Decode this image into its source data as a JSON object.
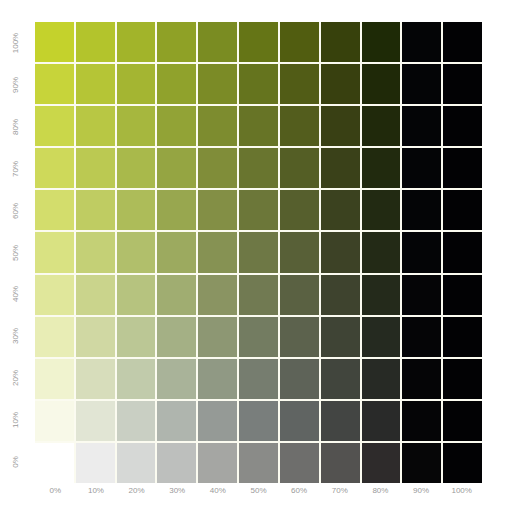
{
  "chart_data": {
    "type": "heatmap",
    "title": "",
    "xlabel": "",
    "ylabel": "",
    "x_ticks": [
      "0%",
      "10%",
      "20%",
      "30%",
      "40%",
      "50%",
      "60%",
      "70%",
      "80%",
      "90%",
      "100%"
    ],
    "y_ticks": [
      "100%",
      "90%",
      "80%",
      "70%",
      "60%",
      "50%",
      "40%",
      "30%",
      "20%",
      "10%",
      "0%"
    ],
    "colors": [
      [
        "#c4d22c",
        "#b3c42c",
        "#a2b42a",
        "#8fa126",
        "#7a8c22",
        "#657516",
        "#515d10",
        "#37410c",
        "#1e2a06",
        "#040506",
        "#020204"
      ],
      [
        "#c7d43a",
        "#b5c536",
        "#a4b532",
        "#90a22c",
        "#7b8b26",
        "#65741e",
        "#515c16",
        "#38400f",
        "#1f2908",
        "#040506",
        "#020204"
      ],
      [
        "#cad74a",
        "#b8c744",
        "#a6b73e",
        "#92a336",
        "#7d8c2f",
        "#677426",
        "#535d1d",
        "#394014",
        "#20290b",
        "#040506",
        "#020204"
      ],
      [
        "#ced95a",
        "#bbc952",
        "#a9b94b",
        "#95a542",
        "#808d39",
        "#69752f",
        "#545e25",
        "#3a4119",
        "#212a0e",
        "#040506",
        "#020204"
      ],
      [
        "#d3dd6c",
        "#bfcc62",
        "#adbc59",
        "#98a74f",
        "#838f45",
        "#6c7739",
        "#565f2d",
        "#3b421f",
        "#222a12",
        "#040506",
        "#020204"
      ],
      [
        "#d9e282",
        "#c4d076",
        "#b1bf6b",
        "#9caa5f",
        "#869253",
        "#6e7845",
        "#586037",
        "#3d4226",
        "#232a16",
        "#040506",
        "#020204"
      ],
      [
        "#e0e79b",
        "#cad48c",
        "#b6c37f",
        "#a0ad71",
        "#8a9462",
        "#717a52",
        "#5a6142",
        "#3e432e",
        "#242a1b",
        "#050506",
        "#020204"
      ],
      [
        "#e8edb5",
        "#d0d8a3",
        "#bbc795",
        "#a4b085",
        "#8d9773",
        "#737c61",
        "#5c624d",
        "#3f4435",
        "#252a20",
        "#050506",
        "#020204"
      ],
      [
        "#f0f3cf",
        "#d7ddbb",
        "#c1cbab",
        "#a9b399",
        "#909984",
        "#767d6f",
        "#5e6358",
        "#41453d",
        "#272a25",
        "#050506",
        "#020204"
      ],
      [
        "#f8f9e8",
        "#e1e5d4",
        "#c9cfc3",
        "#afb5ae",
        "#959a96",
        "#797e7c",
        "#606462",
        "#434543",
        "#292a29",
        "#050506",
        "#020204"
      ],
      [
        "#ffffff",
        "#ececec",
        "#d6d8d6",
        "#bdbfbd",
        "#a5a6a3",
        "#8a8b88",
        "#6e6e6c",
        "#535250",
        "#2e2b2b",
        "#060607",
        "#020204"
      ]
    ]
  },
  "axes": {
    "x_labels": [
      "0%",
      "10%",
      "20%",
      "30%",
      "40%",
      "50%",
      "60%",
      "70%",
      "80%",
      "90%",
      "100%"
    ],
    "y_labels": [
      "100%",
      "90%",
      "80%",
      "70%",
      "60%",
      "50%",
      "40%",
      "30%",
      "20%",
      "10%",
      "0%"
    ]
  },
  "colors": {
    "base": "#c4d22c",
    "label": "#9a9a9a",
    "gridline": "#fbfbf0"
  }
}
